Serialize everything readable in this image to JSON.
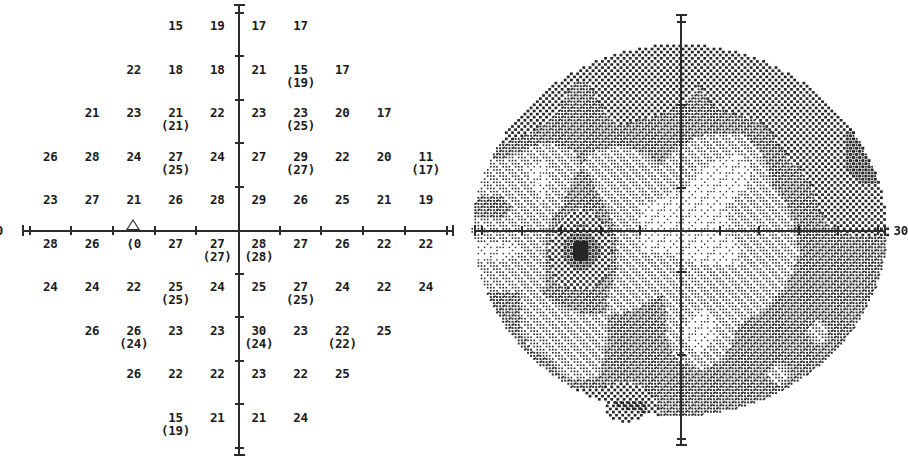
{
  "report": {
    "type": "visual-field-threshold-printout",
    "eye_pattern": "central-30-2",
    "axis_extent_label_left": "30",
    "axis_extent_label_right": "30",
    "blind_spot_symbol": "triangle",
    "blind_spot_value": "⟨0"
  },
  "numeric_plot": {
    "title": "",
    "axis_label_left": "30",
    "units": "dB",
    "grid_spacing_deg": 6,
    "rows": [
      {
        "y": 27,
        "cells": [
          {
            "x": -9,
            "value": "15"
          },
          {
            "x": -3,
            "value": "19"
          },
          {
            "x": 3,
            "value": "17"
          },
          {
            "x": 9,
            "value": "17"
          }
        ]
      },
      {
        "y": 21,
        "cells": [
          {
            "x": -15,
            "value": "22"
          },
          {
            "x": -9,
            "value": "18"
          },
          {
            "x": -3,
            "value": "18"
          },
          {
            "x": 3,
            "value": "21"
          },
          {
            "x": 9,
            "value": "15",
            "retest": "(19)"
          },
          {
            "x": 15,
            "value": "17"
          }
        ]
      },
      {
        "y": 15,
        "cells": [
          {
            "x": -21,
            "value": "21"
          },
          {
            "x": -15,
            "value": "23"
          },
          {
            "x": -9,
            "value": "21",
            "retest": "(21)"
          },
          {
            "x": -3,
            "value": "22"
          },
          {
            "x": 3,
            "value": "23"
          },
          {
            "x": 9,
            "value": "23",
            "retest": "(25)"
          },
          {
            "x": 15,
            "value": "20"
          },
          {
            "x": 21,
            "value": "17"
          }
        ]
      },
      {
        "y": 9,
        "cells": [
          {
            "x": -27,
            "value": "26"
          },
          {
            "x": -21,
            "value": "28"
          },
          {
            "x": -15,
            "value": "24"
          },
          {
            "x": -9,
            "value": "27",
            "retest": "(25)"
          },
          {
            "x": -3,
            "value": "24"
          },
          {
            "x": 3,
            "value": "27"
          },
          {
            "x": 9,
            "value": "29",
            "retest": "(27)"
          },
          {
            "x": 15,
            "value": "22"
          },
          {
            "x": 21,
            "value": "20"
          },
          {
            "x": 27,
            "value": "11",
            "retest": "(17)"
          }
        ]
      },
      {
        "y": 3,
        "cells": [
          {
            "x": -27,
            "value": "23"
          },
          {
            "x": -21,
            "value": "27"
          },
          {
            "x": -15,
            "value": "21"
          },
          {
            "x": -9,
            "value": "26"
          },
          {
            "x": -3,
            "value": "28"
          },
          {
            "x": 3,
            "value": "29"
          },
          {
            "x": 9,
            "value": "26"
          },
          {
            "x": 15,
            "value": "25"
          },
          {
            "x": 21,
            "value": "21"
          },
          {
            "x": 27,
            "value": "19"
          }
        ]
      },
      {
        "y": -3,
        "cells": [
          {
            "x": -27,
            "value": "28"
          },
          {
            "x": -21,
            "value": "26"
          },
          {
            "x": -15,
            "value": "⟨0",
            "blind_spot": true
          },
          {
            "x": -9,
            "value": "27"
          },
          {
            "x": -3,
            "value": "27",
            "retest": "(27)"
          },
          {
            "x": 3,
            "value": "28",
            "retest": "(28)"
          },
          {
            "x": 9,
            "value": "27"
          },
          {
            "x": 15,
            "value": "26"
          },
          {
            "x": 21,
            "value": "22"
          },
          {
            "x": 27,
            "value": "22"
          }
        ]
      },
      {
        "y": -9,
        "cells": [
          {
            "x": -27,
            "value": "24"
          },
          {
            "x": -21,
            "value": "24"
          },
          {
            "x": -15,
            "value": "22"
          },
          {
            "x": -9,
            "value": "25",
            "retest": "(25)"
          },
          {
            "x": -3,
            "value": "24"
          },
          {
            "x": 3,
            "value": "25"
          },
          {
            "x": 9,
            "value": "27",
            "retest": "(25)"
          },
          {
            "x": 15,
            "value": "24"
          },
          {
            "x": 21,
            "value": "22"
          },
          {
            "x": 27,
            "value": "24"
          }
        ]
      },
      {
        "y": -15,
        "cells": [
          {
            "x": -21,
            "value": "26"
          },
          {
            "x": -15,
            "value": "26",
            "retest": "(24)"
          },
          {
            "x": -9,
            "value": "23"
          },
          {
            "x": -3,
            "value": "23"
          },
          {
            "x": 3,
            "value": "30",
            "retest": "(24)"
          },
          {
            "x": 9,
            "value": "23"
          },
          {
            "x": 15,
            "value": "22",
            "retest": "(22)"
          },
          {
            "x": 21,
            "value": "25"
          }
        ]
      },
      {
        "y": -21,
        "cells": [
          {
            "x": -15,
            "value": "26"
          },
          {
            "x": -9,
            "value": "22"
          },
          {
            "x": -3,
            "value": "22"
          },
          {
            "x": 3,
            "value": "23"
          },
          {
            "x": 9,
            "value": "22"
          },
          {
            "x": 15,
            "value": "25"
          }
        ]
      },
      {
        "y": -27,
        "cells": [
          {
            "x": -9,
            "value": "15",
            "retest": "(19)"
          },
          {
            "x": -3,
            "value": "21"
          },
          {
            "x": 3,
            "value": "21"
          },
          {
            "x": 9,
            "value": "24"
          }
        ]
      }
    ]
  },
  "gray_plot": {
    "axis_label_right": "30",
    "legend_levels": [
      {
        "name": "normal-stipple",
        "density": "sparse-dots"
      },
      {
        "name": "mild-reduction",
        "density": "medium-dots"
      },
      {
        "name": "moderate-reduction",
        "density": "crosshatch"
      },
      {
        "name": "severe-defect",
        "density": "dense-crosshatch"
      },
      {
        "name": "absolute-defect",
        "density": "solid-black"
      }
    ],
    "blind_spot_center": {
      "x": -15,
      "y": -3
    },
    "defect_regions": [
      {
        "name": "superior-arcuate-depression",
        "level": "moderate"
      },
      {
        "name": "superior-temporal-depression",
        "level": "moderate"
      },
      {
        "name": "inferior-nasal-step",
        "level": "mild"
      },
      {
        "name": "physiologic-blind-spot",
        "level": "absolute"
      }
    ]
  },
  "chart_data": {
    "type": "heatmap",
    "xlabel": "Horizontal eccentricity (degrees)",
    "ylabel": "Vertical eccentricity (degrees)",
    "xlim": [
      -30,
      30
    ],
    "ylim": [
      -30,
      30
    ],
    "grid": true,
    "legend": "none",
    "x": [
      -27,
      -21,
      -15,
      -9,
      -3,
      3,
      9,
      15,
      21,
      27
    ],
    "y": [
      27,
      21,
      15,
      9,
      3,
      -3,
      -9,
      -15,
      -21,
      -27
    ],
    "values": [
      [
        null,
        null,
        null,
        15,
        19,
        17,
        17,
        null,
        null,
        null
      ],
      [
        null,
        null,
        22,
        18,
        18,
        21,
        15,
        17,
        null,
        null
      ],
      [
        null,
        21,
        23,
        21,
        22,
        23,
        23,
        20,
        17,
        null
      ],
      [
        26,
        28,
        24,
        27,
        24,
        27,
        29,
        22,
        20,
        11
      ],
      [
        23,
        27,
        21,
        26,
        28,
        29,
        26,
        25,
        21,
        19
      ],
      [
        28,
        26,
        0,
        27,
        27,
        28,
        27,
        26,
        22,
        22
      ],
      [
        24,
        24,
        22,
        25,
        24,
        25,
        27,
        24,
        22,
        24
      ],
      [
        null,
        26,
        26,
        23,
        23,
        30,
        23,
        22,
        25,
        null
      ],
      [
        null,
        null,
        26,
        22,
        22,
        23,
        22,
        25,
        null,
        null
      ],
      [
        null,
        null,
        null,
        15,
        21,
        21,
        24,
        null,
        null,
        null
      ]
    ],
    "retest_values": [
      [
        null,
        null,
        null,
        null,
        null,
        null,
        null,
        null,
        null,
        null
      ],
      [
        null,
        null,
        null,
        null,
        null,
        null,
        19,
        null,
        null,
        null
      ],
      [
        null,
        null,
        null,
        21,
        null,
        null,
        25,
        null,
        null,
        null
      ],
      [
        null,
        null,
        null,
        25,
        null,
        null,
        27,
        null,
        null,
        17
      ],
      [
        null,
        null,
        null,
        null,
        null,
        null,
        null,
        null,
        null,
        null
      ],
      [
        null,
        null,
        null,
        null,
        27,
        28,
        null,
        null,
        null,
        null
      ],
      [
        null,
        null,
        null,
        25,
        null,
        null,
        25,
        null,
        null,
        null
      ],
      [
        null,
        null,
        24,
        null,
        null,
        24,
        null,
        22,
        null,
        null
      ],
      [
        null,
        null,
        null,
        null,
        null,
        null,
        null,
        null,
        null,
        null
      ],
      [
        null,
        null,
        null,
        19,
        null,
        null,
        null,
        null,
        null,
        null
      ]
    ]
  }
}
